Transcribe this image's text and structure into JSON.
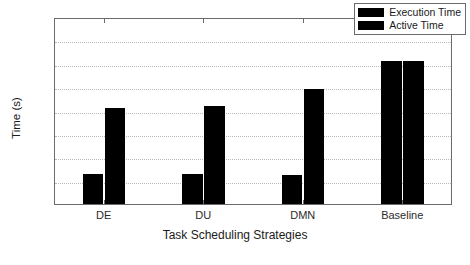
{
  "chart_data": {
    "type": "bar",
    "title": "",
    "xlabel": "Task Scheduling Strategies",
    "ylabel": "Time (s)",
    "categories": [
      "DE",
      "DU",
      "DMN",
      "Baseline"
    ],
    "series": [
      {
        "name": "Execution Time",
        "color": "#000000",
        "values": [
          1300,
          1300,
          1250,
          6100
        ]
      },
      {
        "name": "Active Time",
        "color": "#000000",
        "values": [
          4100,
          4180,
          4900,
          6100
        ]
      }
    ],
    "ylim": [
      0,
      8000
    ],
    "yticks": [
      0,
      1000,
      2000,
      3000,
      4000,
      5000,
      6000,
      7000,
      8000
    ],
    "ytick_labels": [
      "0",
      "1000",
      "2000",
      "3000",
      "4000",
      "5000",
      "6000",
      "7000",
      "8000"
    ],
    "grid": true,
    "grid_axis": "y",
    "grid_style": "dotted",
    "legend_position": "top-right",
    "legend_entries": [
      "Execution Time",
      "Active Time"
    ]
  },
  "figure": {
    "background_color": "#ffffff",
    "axis_color": "#6b6b6b",
    "text_color": "#1a1a1a"
  }
}
